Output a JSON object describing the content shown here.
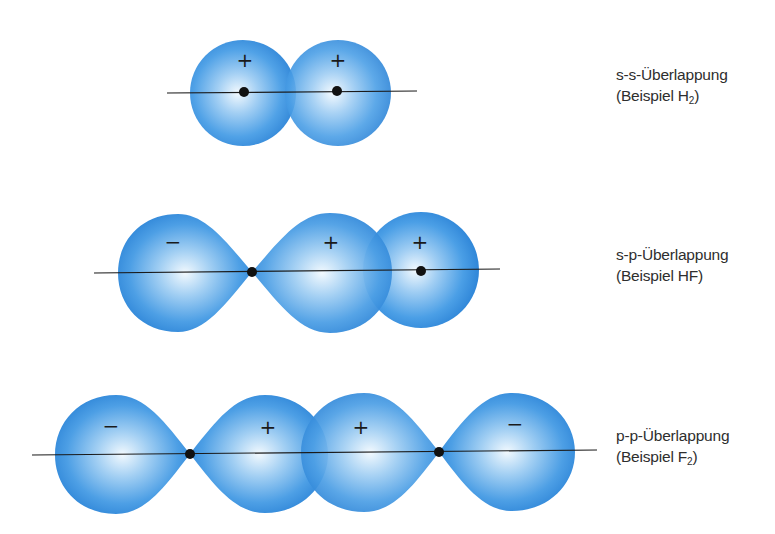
{
  "rows": [
    {
      "id": "s-s",
      "title": "s-s-Überlappung",
      "example_prefix": "(Beispiel H",
      "example_sub": "2",
      "example_suffix": ")",
      "orbitals": [
        {
          "type": "s",
          "sign": "+"
        },
        {
          "type": "s",
          "sign": "+"
        }
      ]
    },
    {
      "id": "s-p",
      "title": "s-p-Überlappung",
      "example_prefix": "(Beispiel HF",
      "example_sub": "",
      "example_suffix": ")",
      "orbitals": [
        {
          "type": "p-lobe",
          "sign": "−"
        },
        {
          "type": "p-lobe",
          "sign": "+"
        },
        {
          "type": "s",
          "sign": "+"
        }
      ]
    },
    {
      "id": "p-p",
      "title": "p-p-Überlappung",
      "example_prefix": "(Beispiel F",
      "example_sub": "2",
      "example_suffix": ")",
      "orbitals": [
        {
          "type": "p-lobe",
          "sign": "−"
        },
        {
          "type": "p-lobe",
          "sign": "+"
        },
        {
          "type": "p-lobe",
          "sign": "+"
        },
        {
          "type": "p-lobe",
          "sign": "−"
        }
      ]
    }
  ],
  "colors": {
    "orbital_edge": "#2f86d8",
    "orbital_mid": "#5aa8ea",
    "orbital_highlight": "#eef7fd",
    "axis": "#1a1a1a",
    "nucleus": "#111111",
    "text": "#2e2e2e"
  }
}
